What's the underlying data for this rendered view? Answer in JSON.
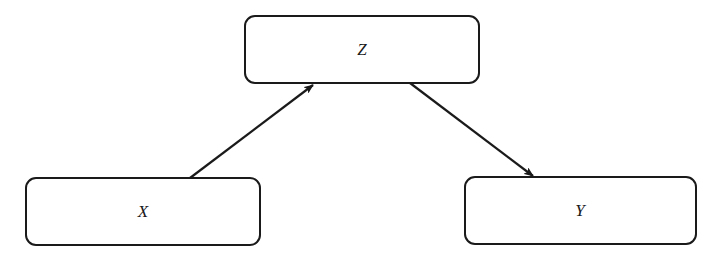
{
  "diagram": {
    "type": "causal-graph",
    "nodes": [
      {
        "id": "Z",
        "label": "Z",
        "x": 245,
        "y": 16,
        "w": 234,
        "h": 67
      },
      {
        "id": "X",
        "label": "X",
        "x": 26,
        "y": 178,
        "w": 234,
        "h": 67
      },
      {
        "id": "Y",
        "label": "Y",
        "x": 465,
        "y": 177,
        "w": 231,
        "h": 67
      }
    ],
    "edges": [
      {
        "from": "X",
        "to": "Z",
        "x1": 190,
        "y1": 178,
        "x2": 313,
        "y2": 85
      },
      {
        "from": "Z",
        "to": "Y",
        "x1": 410,
        "y1": 83,
        "x2": 533,
        "y2": 176
      }
    ],
    "colors": {
      "stroke": "#1a1a1a",
      "fill": "#ffffff",
      "text": "#1a1a1a"
    }
  }
}
